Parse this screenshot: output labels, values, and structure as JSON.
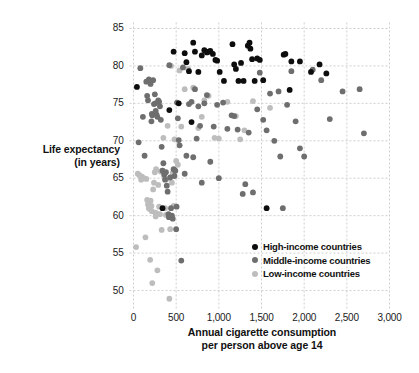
{
  "chart_data": {
    "type": "scatter",
    "title": "",
    "xlabel": "Annual cigarette consumption per person above age 14",
    "xlabel_line1": "Annual cigarette consumption",
    "xlabel_line2": "per person above age 14",
    "ylabel": "Life expectancy (in years)",
    "ylabel_line1": "Life expectancy",
    "ylabel_line2": "(in years)",
    "xlim": [
      0,
      3000
    ],
    "ylim": [
      48,
      85.8
    ],
    "grid": true,
    "xticks": [
      0,
      500,
      1000,
      1500,
      2000,
      2500,
      3000
    ],
    "xticklabels": [
      "0",
      "500",
      "1,000",
      "1,500",
      "2,000",
      "2,500",
      "3,000"
    ],
    "yticks": [
      50,
      55,
      60,
      65,
      70,
      75,
      80,
      85
    ],
    "yticklabels": [
      "50",
      "55",
      "60",
      "65",
      "70",
      "75",
      "80",
      "85"
    ],
    "legend_position": "center-right-inside",
    "colors": {
      "high_income": "#0d0d0d",
      "middle_income": "#6e6e6e",
      "low_income": "#bdbdbd",
      "grid": "#cfcfcf",
      "text": "#111111"
    },
    "series": [
      {
        "name": "High-income countries",
        "color": "#0d0d0d",
        "points": [
          [
            40,
            77.2
          ],
          [
            420,
            74.1
          ],
          [
            470,
            81.9
          ],
          [
            530,
            75.0
          ],
          [
            600,
            81.7
          ],
          [
            620,
            80.5
          ],
          [
            650,
            79.3
          ],
          [
            680,
            72.5
          ],
          [
            700,
            83.1
          ],
          [
            720,
            81.9
          ],
          [
            760,
            79.2
          ],
          [
            800,
            81.4
          ],
          [
            830,
            82.1
          ],
          [
            860,
            81.8
          ],
          [
            880,
            81.9
          ],
          [
            900,
            82.0
          ],
          [
            930,
            81.6
          ],
          [
            960,
            80.8
          ],
          [
            980,
            80.7
          ],
          [
            1010,
            79.2
          ],
          [
            1060,
            78.0
          ],
          [
            1160,
            82.9
          ],
          [
            1180,
            80.2
          ],
          [
            1200,
            79.6
          ],
          [
            1230,
            78.0
          ],
          [
            1260,
            80.4
          ],
          [
            1290,
            78.0
          ],
          [
            1340,
            82.7
          ],
          [
            1360,
            83.1
          ],
          [
            1370,
            82.3
          ],
          [
            1390,
            80.9
          ],
          [
            1420,
            78.0
          ],
          [
            1450,
            81.0
          ],
          [
            1480,
            80.8
          ],
          [
            1520,
            78.1
          ],
          [
            1560,
            61.0
          ],
          [
            1760,
            81.5
          ],
          [
            1780,
            81.6
          ],
          [
            1830,
            76.8
          ],
          [
            1850,
            80.6
          ],
          [
            1950,
            80.6
          ],
          [
            2080,
            79.2
          ],
          [
            2180,
            80.2
          ],
          [
            2260,
            79.0
          ],
          [
            340,
            61.0
          ]
        ]
      },
      {
        "name": "Middle-income countries",
        "color": "#6e6e6e",
        "points": [
          [
            60,
            69.8
          ],
          [
            80,
            79.7
          ],
          [
            110,
            73.2
          ],
          [
            130,
            68.0
          ],
          [
            150,
            77.9
          ],
          [
            160,
            76.0
          ],
          [
            170,
            75.4
          ],
          [
            180,
            78.2
          ],
          [
            190,
            78.0
          ],
          [
            200,
            77.6
          ],
          [
            210,
            72.6
          ],
          [
            215,
            73.6
          ],
          [
            220,
            73.4
          ],
          [
            230,
            78.1
          ],
          [
            240,
            74.9
          ],
          [
            250,
            76.2
          ],
          [
            255,
            75.0
          ],
          [
            260,
            74.0
          ],
          [
            270,
            73.5
          ],
          [
            280,
            73.2
          ],
          [
            290,
            75.4
          ],
          [
            300,
            75.2
          ],
          [
            310,
            74.6
          ],
          [
            320,
            72.8
          ],
          [
            330,
            69.2
          ],
          [
            340,
            66.0
          ],
          [
            350,
            67.0
          ],
          [
            360,
            65.5
          ],
          [
            370,
            64.8
          ],
          [
            380,
            65.8
          ],
          [
            390,
            64.0
          ],
          [
            400,
            63.2
          ],
          [
            410,
            60.2
          ],
          [
            415,
            59.8
          ],
          [
            420,
            80.1
          ],
          [
            430,
            65.1
          ],
          [
            440,
            61.0
          ],
          [
            450,
            60.0
          ],
          [
            460,
            59.6
          ],
          [
            470,
            66.2
          ],
          [
            480,
            65.3
          ],
          [
            490,
            66.0
          ],
          [
            500,
            58.2
          ],
          [
            505,
            61.2
          ],
          [
            510,
            75.1
          ],
          [
            520,
            73.0
          ],
          [
            530,
            70.1
          ],
          [
            540,
            69.4
          ],
          [
            560,
            54.0
          ],
          [
            580,
            79.8
          ],
          [
            600,
            65.6
          ],
          [
            620,
            68.0
          ],
          [
            650,
            74.9
          ],
          [
            680,
            75.2
          ],
          [
            700,
            67.8
          ],
          [
            720,
            76.9
          ],
          [
            740,
            70.3
          ],
          [
            760,
            74.6
          ],
          [
            780,
            72.0
          ],
          [
            800,
            64.4
          ],
          [
            830,
            75.0
          ],
          [
            860,
            76.1
          ],
          [
            900,
            67.2
          ],
          [
            940,
            71.9
          ],
          [
            980,
            74.8
          ],
          [
            1000,
            65.0
          ],
          [
            1050,
            75.1
          ],
          [
            1100,
            71.6
          ],
          [
            1150,
            73.4
          ],
          [
            1180,
            73.3
          ],
          [
            1220,
            71.5
          ],
          [
            1280,
            62.9
          ],
          [
            1310,
            64.2
          ],
          [
            1350,
            71.1
          ],
          [
            1400,
            63.1
          ],
          [
            1450,
            74.2
          ],
          [
            1480,
            79.1
          ],
          [
            1520,
            72.8
          ],
          [
            1560,
            71.4
          ],
          [
            1600,
            76.3
          ],
          [
            1650,
            70.0
          ],
          [
            1700,
            76.6
          ],
          [
            1720,
            67.9
          ],
          [
            1750,
            61.0
          ],
          [
            1800,
            74.8
          ],
          [
            1850,
            79.3
          ],
          [
            1900,
            72.6
          ],
          [
            1950,
            69.0
          ],
          [
            2000,
            67.9
          ],
          [
            2100,
            79.5
          ],
          [
            2200,
            78.1
          ],
          [
            2300,
            72.9
          ],
          [
            2450,
            76.6
          ],
          [
            2650,
            76.9
          ],
          [
            2700,
            71.0
          ]
        ]
      },
      {
        "name": "Low-income countries",
        "color": "#bdbdbd",
        "points": [
          [
            30,
            55.8
          ],
          [
            50,
            65.6
          ],
          [
            70,
            65.4
          ],
          [
            90,
            64.8
          ],
          [
            100,
            65.2
          ],
          [
            120,
            65.0
          ],
          [
            140,
            57.1
          ],
          [
            150,
            64.9
          ],
          [
            160,
            62.1
          ],
          [
            170,
            61.5
          ],
          [
            180,
            61.0
          ],
          [
            185,
            61.8
          ],
          [
            190,
            60.9
          ],
          [
            195,
            54.1
          ],
          [
            200,
            62.0
          ],
          [
            210,
            61.3
          ],
          [
            215,
            60.6
          ],
          [
            220,
            51.0
          ],
          [
            230,
            63.5
          ],
          [
            240,
            64.4
          ],
          [
            250,
            65.8
          ],
          [
            255,
            60.4
          ],
          [
            260,
            59.9
          ],
          [
            265,
            66.2
          ],
          [
            270,
            60.3
          ],
          [
            280,
            52.7
          ],
          [
            290,
            64.1
          ],
          [
            300,
            61.2
          ],
          [
            310,
            60.2
          ],
          [
            320,
            65.9
          ],
          [
            330,
            58.1
          ],
          [
            340,
            66.0
          ],
          [
            350,
            70.4
          ],
          [
            360,
            65.2
          ],
          [
            370,
            61.0
          ],
          [
            380,
            60.1
          ],
          [
            390,
            64.9
          ],
          [
            400,
            72.0
          ],
          [
            420,
            48.9
          ],
          [
            430,
            58.2
          ],
          [
            440,
            80.0
          ],
          [
            450,
            64.4
          ],
          [
            460,
            65.7
          ],
          [
            470,
            61.3
          ],
          [
            480,
            70.2
          ],
          [
            500,
            67.3
          ],
          [
            520,
            66.8
          ],
          [
            540,
            79.4
          ],
          [
            560,
            71.9
          ],
          [
            600,
            76.9
          ],
          [
            640,
            79.6
          ],
          [
            700,
            77.1
          ],
          [
            760,
            71.7
          ],
          [
            800,
            73.2
          ],
          [
            830,
            75.4
          ],
          [
            880,
            76.0
          ],
          [
            950,
            70.4
          ],
          [
            1000,
            70.3
          ],
          [
            1100,
            75.2
          ],
          [
            1200,
            73.3
          ],
          [
            1250,
            70.2
          ],
          [
            1300,
            71.4
          ],
          [
            1400,
            75.3
          ],
          [
            1600,
            74.4
          ]
        ]
      }
    ]
  },
  "legend": {
    "items": [
      {
        "label": "High-income countries",
        "color": "#0d0d0d"
      },
      {
        "label": "Middle-income countries",
        "color": "#6e6e6e"
      },
      {
        "label": "Low-income countries",
        "color": "#bdbdbd"
      }
    ]
  }
}
